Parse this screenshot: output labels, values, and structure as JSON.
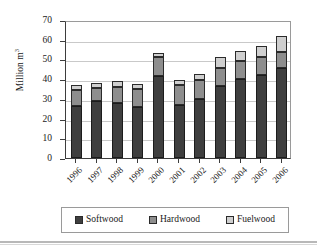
{
  "chart_data": {
    "type": "bar",
    "subtype": "stacked-bar",
    "title": "",
    "xlabel": "",
    "ylabel": "Million m³",
    "ylabel_base": "Million m",
    "ylabel_sup": "3",
    "ylim": [
      0,
      70
    ],
    "yticks": [
      0,
      10,
      20,
      30,
      40,
      50,
      60,
      70
    ],
    "ytick_labels": [
      "0",
      "10",
      "20",
      "30",
      "40",
      "50",
      "60",
      "70"
    ],
    "grid": true,
    "grid_axis": "y",
    "legend_position": "bottom",
    "categories": [
      "1996",
      "1997",
      "1998",
      "1999",
      "2000",
      "2001",
      "2002",
      "2003",
      "2004",
      "2005",
      "2006"
    ],
    "series": [
      {
        "name": "Softwood",
        "color": "#3f3f3f",
        "values": [
          26.5,
          29.0,
          28.0,
          26.0,
          41.5,
          27.0,
          30.0,
          36.5,
          40.0,
          42.0,
          45.5
        ]
      },
      {
        "name": "Hardwood",
        "color": "#8e8e8e",
        "values": [
          8.0,
          6.5,
          8.0,
          9.0,
          9.5,
          10.0,
          9.5,
          9.0,
          9.0,
          9.0,
          8.5
        ]
      },
      {
        "name": "Fuelwood",
        "color": "#cfcfcf",
        "values": [
          2.5,
          2.5,
          3.0,
          2.5,
          2.5,
          2.5,
          3.0,
          5.5,
          5.5,
          6.0,
          8.0
        ]
      }
    ],
    "totals": [
      37.0,
      38.0,
      39.0,
      37.5,
      53.5,
      39.5,
      42.5,
      51.0,
      54.5,
      57.0,
      62.0
    ]
  },
  "legend": {
    "items": [
      {
        "label": "Softwood",
        "color": "#3f3f3f"
      },
      {
        "label": "Hardwood",
        "color": "#8e8e8e"
      },
      {
        "label": "Fuelwood",
        "color": "#cfcfcf"
      }
    ]
  },
  "colors": {
    "softwood": "#3f3f3f",
    "hardwood": "#8e8e8e",
    "fuelwood": "#cfcfcf",
    "axis": "#3d3d3d",
    "grid": "#c9c9c9",
    "background": "#ffffff"
  }
}
